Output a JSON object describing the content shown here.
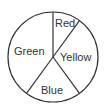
{
  "chart_data": {
    "type": "pie",
    "title": "",
    "categories": [
      "Red",
      "Yellow",
      "Blue",
      "Green"
    ],
    "values": [
      10,
      30,
      20,
      40
    ],
    "unit": "percent (estimated from slice angles)",
    "start_angle_deg": 0,
    "direction": "clockwise",
    "fill": "none",
    "stroke_color": "#333333",
    "labels_inside": true
  },
  "labels": {
    "red": "Red",
    "yellow": "Yellow",
    "blue": "Blue",
    "green": "Green"
  }
}
